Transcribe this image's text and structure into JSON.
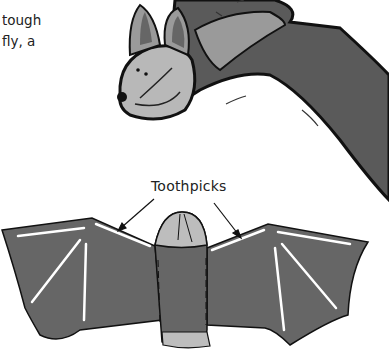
{
  "text_fragment": {
    "lines": [
      "tough",
      "fly, a"
    ]
  },
  "illustration_top": {
    "subject": "sock bat puppet in flight",
    "colors": {
      "wing": "#555555",
      "head": "#b5b5b5",
      "fur": "#999999",
      "outline": "#111111"
    }
  },
  "illustration_bottom": {
    "subject": "bat puppet with outstretched wings",
    "label": "Toothpicks",
    "colors": {
      "wing": "#666666",
      "body_top": "#bdbdbd",
      "toothpick": "#ffffff",
      "outline": "#111111"
    }
  }
}
